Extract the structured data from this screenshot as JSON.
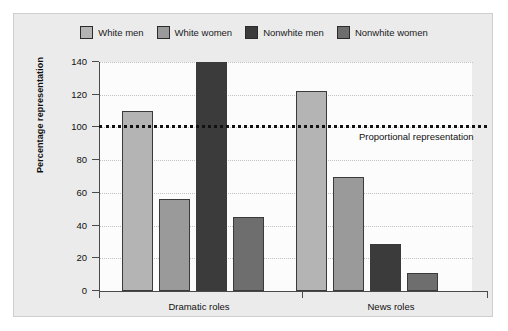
{
  "chart_data": {
    "type": "bar",
    "title": "",
    "xlabel": "",
    "ylabel": "Percentage representation",
    "ylim": [
      0,
      140
    ],
    "yticks": [
      0,
      20,
      40,
      60,
      80,
      100,
      120,
      140
    ],
    "grid": true,
    "legend_position": "top",
    "categories": [
      "Dramatic roles",
      "News roles"
    ],
    "series": [
      {
        "name": "White men",
        "color": "#b4b4b4",
        "values": [
          110,
          122
        ]
      },
      {
        "name": "White women",
        "color": "#9a9a9a",
        "values": [
          56,
          70
        ]
      },
      {
        "name": "Nonwhite men",
        "color": "#3b3b3b",
        "values": [
          140,
          29
        ]
      },
      {
        "name": "Nonwhite women",
        "color": "#6e6e6e",
        "values": [
          45,
          11
        ]
      }
    ],
    "annotations": [
      {
        "name": "proportional-representation-line",
        "text": "Proportional representation",
        "value": 100,
        "style": "dotted"
      }
    ]
  },
  "colors": {
    "panel_background": "#ebebeb",
    "plot_background": "#fcfcfc",
    "axis": "#4a4a4a",
    "grid": "#c2c2c2",
    "text": "#111111"
  }
}
